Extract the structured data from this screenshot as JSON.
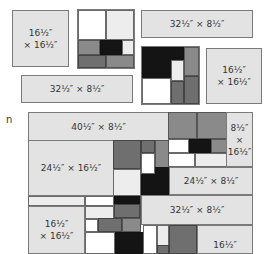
{
  "diagram": {
    "pieces": {
      "top_left_square": "16½″\n× 16½″",
      "top_right_strip": "32½″ × 8½″",
      "mid_left_strip": "32½″ × 8½″",
      "mid_right_square": "16½″\n× 16½″"
    },
    "assembly": {
      "row1_strip": "40½″ × 8½″",
      "right_tall": "8½″\n×\n16½″",
      "left_block": "24½″ × 16½″",
      "right_strip_1": "24½″ × 8½″",
      "right_strip_2": "32½″ × 8½″",
      "bottom_left_square": "16½″\n× 16½″",
      "bottom_right_partial": "16½″"
    },
    "stray_text": "n"
  },
  "colors": {
    "panel": "#e3e3e3",
    "white": "#ffffff",
    "light": "#ededed",
    "mid_gray": "#8a8a8a",
    "dark_gray": "#6f6f6f",
    "black": "#141414"
  }
}
